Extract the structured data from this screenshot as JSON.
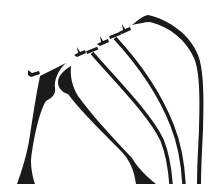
{
  "diagram": {
    "ink_color": "#1a1a1a",
    "background_color": "#ffffff",
    "hooks": [
      {
        "name": "hook-1",
        "x": 30,
        "y": 73
      },
      {
        "name": "hook-2",
        "x": 78,
        "y": 52
      },
      {
        "name": "hook-3",
        "x": 101,
        "y": 42
      },
      {
        "name": "hook-4",
        "x": 124,
        "y": 30
      }
    ],
    "strands": [
      {
        "name": "wedge-strand-1",
        "type": "tapered-wedge"
      },
      {
        "name": "wedge-strand-2",
        "type": "crescent-wedge"
      },
      {
        "name": "curve-strand-3",
        "type": "thin-curve"
      },
      {
        "name": "curve-strand-4",
        "type": "thin-curve"
      },
      {
        "name": "arch-strand-5",
        "type": "arch"
      }
    ]
  }
}
